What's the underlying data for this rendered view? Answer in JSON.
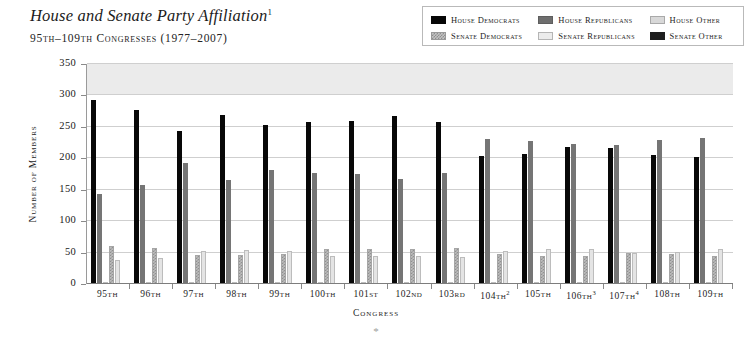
{
  "header": {
    "title": "House and Senate Party Affiliation",
    "title_footnote": "1",
    "subtitle": "95th–109th Congresses (1977–2007)"
  },
  "legend": {
    "items": [
      {
        "key": "house_democrats",
        "label": "House Democrats",
        "swatch": "solid-black-swatch",
        "color": "#060606"
      },
      {
        "key": "house_republicans",
        "label": "House Republicans",
        "swatch": "solid-gray-swatch",
        "color": "#6e6e6e"
      },
      {
        "key": "house_other",
        "label": "House Other",
        "swatch": "light-gray-swatch",
        "color": "#d8d8d8"
      },
      {
        "key": "senate_democrats",
        "label": "Senate Democrats",
        "swatch": "checkered-gray-swatch",
        "color": "#c3c3c3"
      },
      {
        "key": "senate_republicans",
        "label": "Senate Republicans",
        "swatch": "pale-gray-swatch",
        "color": "#ececec"
      },
      {
        "key": "senate_other",
        "label": "Senate Other",
        "swatch": "solid-dark-swatch",
        "color": "#1e1e1e"
      }
    ]
  },
  "axes": {
    "y_title": "Number of Members",
    "x_title": "Congress",
    "y_ticks": [
      0,
      50,
      100,
      150,
      200,
      250,
      300,
      350
    ],
    "footnote_mark": "*"
  },
  "chart_data": {
    "type": "bar",
    "title": "House and Senate Party Affiliation",
    "subtitle": "95th–109th Congresses (1977–2007)",
    "xlabel": "Congress",
    "ylabel": "Number of Members",
    "ylim": [
      0,
      350
    ],
    "ytick_step": 50,
    "grid": true,
    "legend_position": "top-right",
    "categories": [
      "95th",
      "96th",
      "97th",
      "98th",
      "99th",
      "100th",
      "101st",
      "102nd",
      "103rd",
      "104th",
      "105th",
      "106th",
      "107th",
      "108th",
      "109th"
    ],
    "category_footnotes": {
      "104th": "2",
      "106th": "3",
      "107th": "4"
    },
    "series": [
      {
        "name": "House Democrats",
        "values": [
          292,
          277,
          243,
          269,
          253,
          258,
          260,
          268,
          258,
          204,
          207,
          218,
          216,
          205,
          202
        ]
      },
      {
        "name": "House Republicans",
        "values": [
          143,
          158,
          192,
          166,
          182,
          177,
          175,
          167,
          176,
          230,
          227,
          223,
          221,
          229,
          232
        ]
      },
      {
        "name": "House Other",
        "values": [
          0,
          0,
          0,
          0,
          0,
          0,
          0,
          0,
          1,
          1,
          1,
          1,
          2,
          1,
          1
        ]
      },
      {
        "name": "Senate Democrats",
        "values": [
          61,
          58,
          46,
          46,
          47,
          55,
          55,
          56,
          57,
          48,
          45,
          45,
          50,
          48,
          44
        ]
      },
      {
        "name": "Senate Republicans",
        "values": [
          38,
          41,
          53,
          54,
          53,
          45,
          45,
          44,
          43,
          52,
          55,
          55,
          50,
          51,
          55
        ]
      },
      {
        "name": "Senate Other",
        "values": [
          1,
          1,
          1,
          0,
          0,
          0,
          0,
          0,
          0,
          0,
          0,
          0,
          0,
          1,
          1
        ]
      }
    ]
  }
}
